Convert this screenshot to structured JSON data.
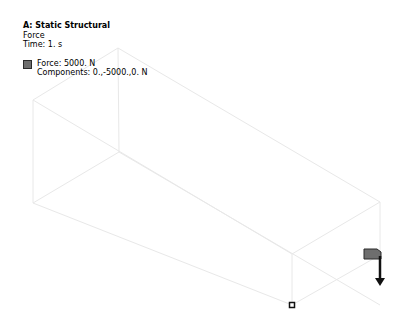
{
  "analysis": {
    "title": "A: Static Structural",
    "object": "Force",
    "time_label": "Time: 1. s"
  },
  "legend": {
    "entries": [
      {
        "label": "Force: 5000. N",
        "components": "Components: 0.,-5000.,0. N",
        "color": "#6e6e6e"
      }
    ]
  },
  "geometry": {
    "type": "wireframe-box",
    "edge_color": "#ececec"
  },
  "annotations": {
    "force_arrow": {
      "direction": "-Y",
      "color": "#111111"
    },
    "triad_marker": "origin-marker"
  }
}
